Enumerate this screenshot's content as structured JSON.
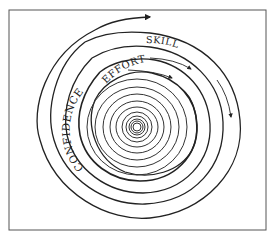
{
  "diagram": {
    "labels": {
      "skills": "SKILLS",
      "effort": "EFFORT",
      "confidence": "CONFIDENCE"
    },
    "colors": {
      "stroke": "#222222",
      "frame": "#555555",
      "background": "#ffffff"
    },
    "frame": {
      "x": 9,
      "y": 10,
      "width": 257,
      "height": 220
    },
    "center": {
      "x": 137,
      "y": 127
    },
    "rings": [
      {
        "name": "outer-arrow-ring",
        "r": 100
      },
      {
        "name": "skills-ring",
        "r": 91
      },
      {
        "name": "effort-ring",
        "r": 79
      },
      {
        "name": "confidence-ring",
        "r": 67
      },
      {
        "name": "inner-ring",
        "r": 57
      }
    ],
    "spiral_inner_radii": [
      48,
      40,
      33,
      27,
      21,
      16,
      12,
      9,
      7,
      5
    ]
  }
}
